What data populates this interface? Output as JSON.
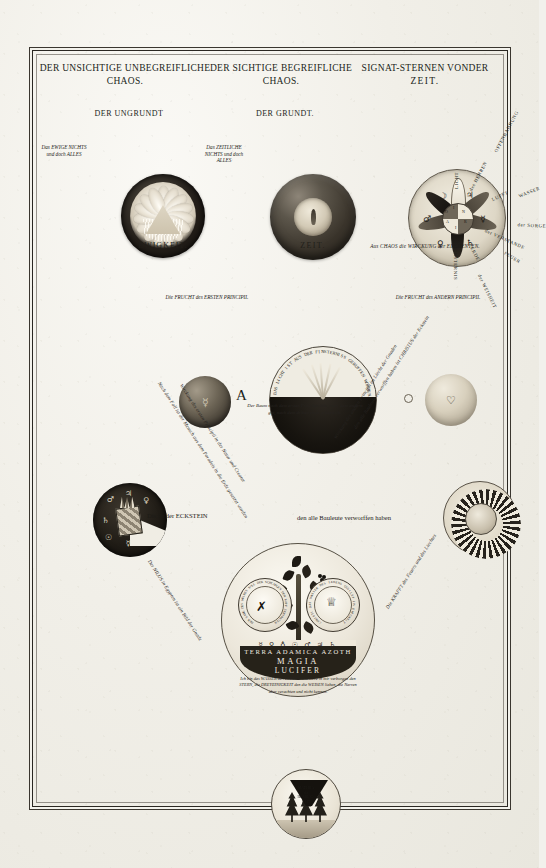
{
  "plate": {
    "medium": "engraving",
    "language": "German",
    "headers": [
      {
        "id": "left",
        "line1": "DER UNSICHTIGE UNBEGREIFLICHE",
        "line2": "CHAOS."
      },
      {
        "id": "middle",
        "line1": "DER SICHTIGE BEGREIFLICHE",
        "line2": "CHAOS."
      },
      {
        "id": "right",
        "line1": "SIGNAT-STERNEN VONDER",
        "line2": "ZEIT."
      }
    ],
    "panels": {
      "ungrundt": {
        "title": "DER UNGRUNDT",
        "caption": "EWIGKEIT.",
        "side_note": "Das EWIGE NICHTS und doch ALLES",
        "triangle_text": "Vatter\nSohn  Geist"
      },
      "grundt": {
        "title": "DER GRUNDT.",
        "caption": "ZEIT.",
        "side_note": "Das ZEITLICHE NICHTS und doch ALLES"
      },
      "starrose": {
        "caption": "Aus CHAOS die WIRCKUNG der ELEMENTEN.",
        "radials": [
          {
            "label": "LICHT",
            "angle": -90
          },
          {
            "label": "des HERREN",
            "angle": -62
          },
          {
            "label": "LUFFT",
            "angle": -26
          },
          {
            "label": "der VERSTANDE",
            "angle": -2
          },
          {
            "label": "ERDE",
            "angle": 26
          },
          {
            "label": "FINSTERNIS",
            "angle": 90
          },
          {
            "label": "OFFENBAHRUNG",
            "angle": 132
          },
          {
            "label": "WASSER",
            "angle": 160
          },
          {
            "label": "der SORGE",
            "angle": 183
          },
          {
            "label": "FEUER",
            "angle": 210
          },
          {
            "label": "der WEISHEIT",
            "angle": 242
          }
        ],
        "sigils": [
          "☽",
          "♃",
          "♀",
          "☿",
          "♄",
          "♂",
          "☉"
        ],
        "hub_letters": [
          "I",
          "N",
          "R",
          "I",
          "A",
          "O",
          "L"
        ]
      }
    },
    "center": {
      "orb_arc_text": "DAS LICHT IST AUS DER FINSTERNISS GERUFFEN WORDEN",
      "marker_letter": "A",
      "fruit_left_label": "Die FRUCHT des ERSTEN PRINCIPII.",
      "fruit_right_label": "Die FRUCHT des ANDERN PRINCIPII.",
      "tree_note": "Der Baum nach dem ersten Principio bös, nach dem andern gut, nach dem dritten ist er erkentlich."
    },
    "eckstein": {
      "text_left": "Dis ist der ECKSTEIN",
      "text_right": "den alle Bauleute verworffen haben"
    },
    "globe": {
      "band_line1": "TERRA ADAMICA AZOTH",
      "band_line2": "MAGIA",
      "band_line3": "LUCIFER",
      "band_sigils": "☿ ♀ ♁ ☉ ♂ ♃ ♄",
      "medallion_left_ring": "DER SAME DES WEIBES SOLL DER SCHLANGEN DEN KOPF ZERTRETEN",
      "medallion_right_ring": "CHRISTI DAS WASSER DES LEBENS QUILLET IN EWIGKEIT",
      "inscription": "Ich bin das WASSER des LEBENS und habe in mir verborgen den STERN, die DREYEINIGKEIT den die WEISEN lieben, die Narren aber verachten und nicht kennen."
    },
    "bottom": {
      "label_line1": "MATERIA",
      "label_line2": "der",
      "label_line3": "HERRLIG-",
      "label_line4": "KEIT"
    },
    "diagonals": {
      "left_outer": "Nach dem Fall ist der Mensch aus dem Paradeis in die Erde gesetzet worden",
      "left_inner": "Wirckung des ersten Principii in der Natur und Creatur",
      "right_inner": "Wirckung des andern Principii im Liecht der Gnaden",
      "right_outer": "den alle Bauleute verworffen haben ist CHRISTUS der Eckstein",
      "left_lower": "Der NILUS in Egypten ist ein Bild der Gnade",
      "right_lower": "Die KRAFFT des Feuers und des Liechtes"
    }
  }
}
